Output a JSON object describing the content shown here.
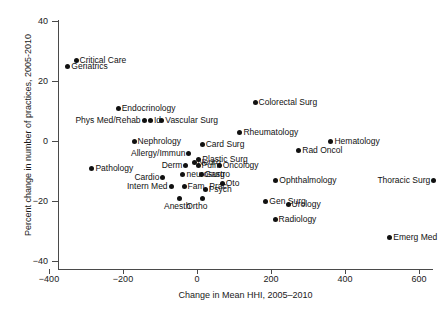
{
  "chart_data": {
    "type": "scatter",
    "title": "",
    "xlabel": "Change in Mean HHI, 2005–2010",
    "ylabel": "Percent change in number of practices, 2005-2010",
    "xlim": [
      -440,
      690
    ],
    "ylim": [
      -45,
      45
    ],
    "xticks": [
      -400,
      -200,
      0,
      200,
      400,
      600
    ],
    "yticks": [
      40,
      20,
      0,
      -20,
      -40
    ],
    "xtick_labels": [
      "−400",
      "−200",
      "0",
      "200",
      "400",
      "600"
    ],
    "ytick_labels": [
      "40",
      "20",
      "0",
      "−20",
      "−40"
    ],
    "grid": false,
    "legend": "none",
    "marker_color": "#111111",
    "axis_color": "#4a4a4a",
    "points": [
      {
        "label": "Critical Care",
        "x": -327,
        "y": 27,
        "lab": "right"
      },
      {
        "label": "Geriatrics",
        "x": -349,
        "y": 25,
        "lab": "right"
      },
      {
        "label": "Endocrinology",
        "x": -213,
        "y": 11,
        "lab": "right"
      },
      {
        "label": "Phys Med/Rehab",
        "x": -143,
        "y": 7,
        "lab": "left"
      },
      {
        "label": "Id",
        "x": -126,
        "y": 7,
        "lab": "right"
      },
      {
        "label": "Vascular Surg",
        "x": -95,
        "y": 7,
        "lab": "right"
      },
      {
        "label": "Nephrology",
        "x": -170,
        "y": 0,
        "lab": "right"
      },
      {
        "label": "Card Surg",
        "x": 14,
        "y": -1,
        "lab": "right"
      },
      {
        "label": "Rheumatology",
        "x": 116,
        "y": 3,
        "lab": "right"
      },
      {
        "label": "Colorectal Surg",
        "x": 157,
        "y": 13,
        "lab": "right"
      },
      {
        "label": "Hematology",
        "x": 362,
        "y": 0,
        "lab": "right"
      },
      {
        "label": "Rad Oncol",
        "x": 275,
        "y": -3,
        "lab": "right"
      },
      {
        "label": "Allergy/Immun",
        "x": -22,
        "y": -4,
        "lab": "left"
      },
      {
        "label": "Plastic Surg",
        "x": 5,
        "y": -6,
        "lab": "right"
      },
      {
        "label": "Derm",
        "x": -30,
        "y": -8,
        "lab": "left"
      },
      {
        "label": "Neuro",
        "x": -8,
        "y": -7,
        "lab": "right"
      },
      {
        "label": "Pulm",
        "x": 3,
        "y": -8,
        "lab": "right"
      },
      {
        "label": "Oncology",
        "x": 60,
        "y": -8,
        "lab": "right"
      },
      {
        "label": "Pathology",
        "x": -284,
        "y": -9,
        "lab": "right"
      },
      {
        "label": "Cardio",
        "x": -92,
        "y": -12,
        "lab": "left"
      },
      {
        "label": "neurosurg",
        "x": -38,
        "y": -11,
        "lab": "right"
      },
      {
        "label": "Gastro",
        "x": 11,
        "y": -11,
        "lab": "right"
      },
      {
        "label": "Ophthalmology",
        "x": 213,
        "y": -13,
        "lab": "right"
      },
      {
        "label": "Thoracic Surg",
        "x": 640,
        "y": -13,
        "lab": "left"
      },
      {
        "label": "Intern Med",
        "x": -70,
        "y": -15,
        "lab": "left"
      },
      {
        "label": "Fam. Prac",
        "x": -35,
        "y": -15,
        "lab": "right"
      },
      {
        "label": "Psych",
        "x": 22,
        "y": -16,
        "lab": "right"
      },
      {
        "label": "Oto",
        "x": 68,
        "y": -14,
        "lab": "right"
      },
      {
        "label": "Anesth",
        "x": -46,
        "y": -19,
        "lab": "below"
      },
      {
        "label": "Ortho",
        "x": 14,
        "y": -19,
        "lab": "below"
      },
      {
        "label": "Gen Surg",
        "x": 186,
        "y": -20,
        "lab": "right"
      },
      {
        "label": "Urology",
        "x": 246,
        "y": -21,
        "lab": "right"
      },
      {
        "label": "Radiology",
        "x": 211,
        "y": -26,
        "lab": "right"
      },
      {
        "label": "Emerg Med",
        "x": 521,
        "y": -32,
        "lab": "right"
      }
    ]
  }
}
